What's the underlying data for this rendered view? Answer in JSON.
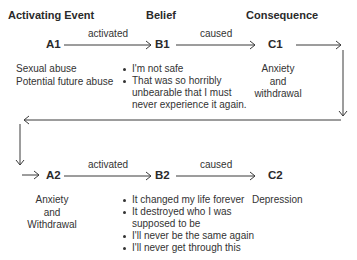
{
  "headers": {
    "activating_event": "Activating Event",
    "belief": "Belief",
    "consequence": "Consequence"
  },
  "row1": {
    "a": {
      "node": "A1",
      "items": [
        "Sexual abuse",
        "Potential future abuse"
      ]
    },
    "ab_label": "activated",
    "b": {
      "node": "B1",
      "items": [
        "I'm not safe",
        "That was so horribly unbearable that I must never experience it again."
      ],
      "item_lines": [
        [
          "I'm not safe"
        ],
        [
          "That was so horribly",
          "unbearable that I must",
          "never experience it again."
        ]
      ]
    },
    "bc_label": "caused",
    "c": {
      "node": "C1",
      "lines": [
        "Anxiety",
        "and",
        "withdrawal"
      ]
    }
  },
  "row2": {
    "a": {
      "node": "A2",
      "lines": [
        "Anxiety",
        "and",
        "Withdrawal"
      ]
    },
    "ab_label": "activated",
    "b": {
      "node": "B2",
      "items": [
        "It changed my life forever",
        "It destroyed who I was supposed to be",
        "I'll never be the same again",
        "I'll never get through this"
      ],
      "item_lines": [
        [
          "It changed my life forever"
        ],
        [
          "It destroyed who I was",
          "supposed to be"
        ],
        [
          "I'll never be the same again"
        ],
        [
          "I'll never get through this"
        ]
      ]
    },
    "bc_label": "caused",
    "c": {
      "node": "C2",
      "lines": [
        "Depression"
      ]
    }
  },
  "colors": {
    "line": "#3a3a3a",
    "text": "#2a2a2a"
  }
}
